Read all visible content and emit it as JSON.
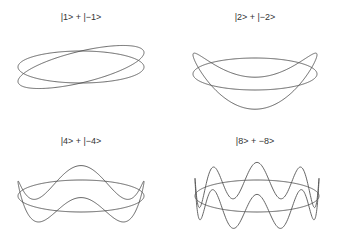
{
  "figure": {
    "panels": [
      {
        "title": "|1> + |−1>",
        "n": 1,
        "wave_amplitude": 0.9
      },
      {
        "title": "|2> + |−2>",
        "n": 2,
        "wave_amplitude": 1.2
      },
      {
        "title": "|4> + |−4>",
        "n": 4,
        "wave_amplitude": 0.9
      },
      {
        "title": "|8> + −8>",
        "n": 8,
        "wave_amplitude": 1.1
      }
    ],
    "curve_color": "#555555"
  }
}
